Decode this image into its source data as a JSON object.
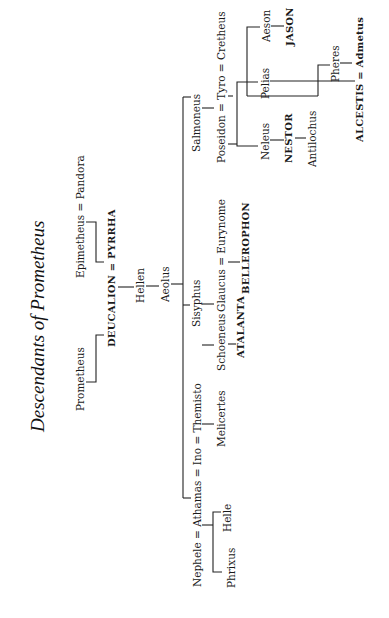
{
  "title": "Descendants of Prometheus",
  "generations": {
    "g1": {
      "prometheus": "Prometheus",
      "epimetheus_pandora": "Epimetheus = Pandora"
    },
    "g2": {
      "deucalion_pyrrha": "DEUCALION = PYRRHA"
    },
    "g3": {
      "hellen": "Hellen"
    },
    "g4": {
      "aeolus": "Aeolus"
    },
    "g5": {
      "nephele_athamas_ino_themisto": "Nephele = Athamas = Ino = Themisto",
      "sisyphus": "Sisyphus",
      "salmoneus": "Salmoneus"
    },
    "g6": {
      "phrixus": "Phrixus",
      "helle": "Helle",
      "melicertes": "Melicertes",
      "schoeneus": "Schoeneus",
      "glaucus_eurynome": "Glaucus = Eurynome",
      "poseidon_tyro_cretheus": "Poseidon = Tyro = Cretheus"
    },
    "g7": {
      "atalanta": "ATALANTA",
      "bellerophon": "BELLEROPHON",
      "neleus": "Neleus",
      "pelias": "Pelias",
      "aeson": "Aeson",
      "pheres": "Pheres"
    },
    "g8": {
      "nestor": "NESTOR",
      "jason": "JASON",
      "alcestis_admetus": "ALCESTIS = Admetus"
    },
    "g9": {
      "antilochus": "Antilochus"
    }
  },
  "orientation": "rotated -90deg (text reads bottom to top)",
  "colors": {
    "ink": "#1a1a1a",
    "background": "#ffffff"
  }
}
